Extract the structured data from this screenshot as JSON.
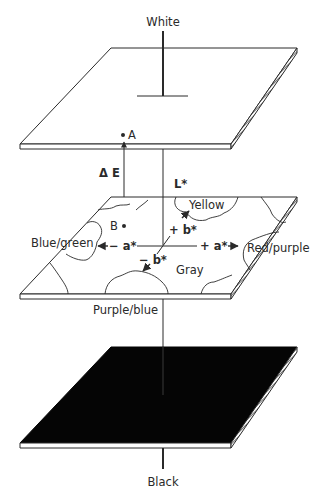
{
  "diagram": {
    "colors": {
      "ink": "#2a2a2a",
      "plane_white": "#ffffff",
      "plane_black": "#050505",
      "background": "#ffffff"
    },
    "poles": {
      "top": "White",
      "bottom": "Black"
    },
    "planes": [
      {
        "id": "white-plane",
        "fill": "white"
      },
      {
        "id": "color-plane",
        "fill": "white"
      },
      {
        "id": "black-plane",
        "fill": "black"
      }
    ],
    "points": {
      "a": "A",
      "b": "B"
    },
    "labels": {
      "delta_e": "Δ E",
      "l_axis": "L*",
      "plus_a": "+ a*",
      "minus_a": "− a*",
      "plus_b": "+ b*",
      "minus_b": "− b*"
    },
    "regions": {
      "yellow": "Yellow",
      "blue_green": "Blue/green",
      "red_purple": "Red/purple",
      "gray": "Gray",
      "purple_blue": "Purple/blue"
    }
  }
}
